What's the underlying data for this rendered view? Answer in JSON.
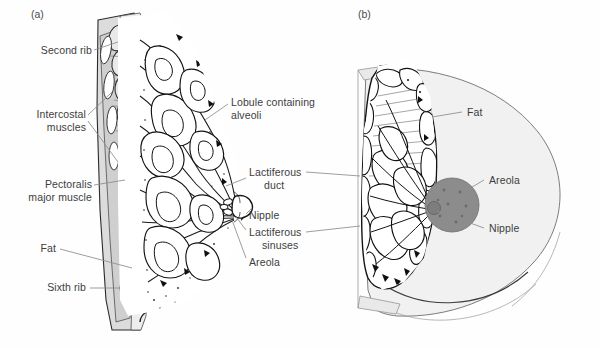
{
  "figure": {
    "background_color": "#fefefe",
    "label_text_color": "#3d3d3d",
    "leader_line_color": "#8d8d8d",
    "ink_color": "#1a1a1a",
    "areola_fill_color": "#8c8c8c",
    "skin_fill_color": "#f2f2f2",
    "muscle_fill_color": "#d9d9d9",
    "rib_fill_color": "#e6e6e6"
  },
  "panels": [
    {
      "id": "a",
      "tag": "(a)",
      "view": "sagittal section through the breast and chest wall",
      "labels": [
        {
          "name": "second-rib",
          "text": "Second rib",
          "align": "right"
        },
        {
          "name": "intercostal",
          "text": "Intercostal\nmuscles",
          "align": "right"
        },
        {
          "name": "pectoralis",
          "text": "Pectoralis\nmajor muscle",
          "align": "right"
        },
        {
          "name": "fat-a",
          "text": "Fat",
          "align": "right"
        },
        {
          "name": "sixth-rib",
          "text": "Sixth rib",
          "align": "right"
        },
        {
          "name": "lobule",
          "text": "Lobule containing\nalveoli",
          "align": "left"
        },
        {
          "name": "lactiferous-duct",
          "text": "Lactiferous\nduct",
          "align": "left"
        },
        {
          "name": "nipple-a",
          "text": "Nipple",
          "align": "left"
        },
        {
          "name": "lactiferous-sinuses",
          "text": "Lactiferous\nsinuses",
          "align": "left"
        },
        {
          "name": "areola-a",
          "text": "Areola",
          "align": "left"
        }
      ]
    },
    {
      "id": "b",
      "tag": "(b)",
      "view": "anterior view with cut-away sagittal section",
      "labels": [
        {
          "name": "fat-b",
          "text": "Fat",
          "align": "left"
        },
        {
          "name": "areola-b",
          "text": "Areola",
          "align": "left"
        },
        {
          "name": "nipple-b",
          "text": "Nipple",
          "align": "left"
        }
      ]
    }
  ],
  "label_text": {
    "panel_a_tag": "(a)",
    "panel_b_tag": "(b)",
    "second_rib": "Second rib",
    "intercostal_l1": "Intercostal",
    "intercostal_l2": "muscles",
    "pectoralis_l1": "Pectoralis",
    "pectoralis_l2": "major muscle",
    "fat_a": "Fat",
    "sixth_rib": "Sixth rib",
    "lobule_l1": "Lobule containing",
    "lobule_l2": "alveoli",
    "duct_l1": "Lactiferous",
    "duct_l2": "duct",
    "nipple_a": "Nipple",
    "sinuses_l1": "Lactiferous",
    "sinuses_l2": "sinuses",
    "areola_a": "Areola",
    "fat_b": "Fat",
    "areola_b": "Areola",
    "nipple_b": "Nipple"
  }
}
